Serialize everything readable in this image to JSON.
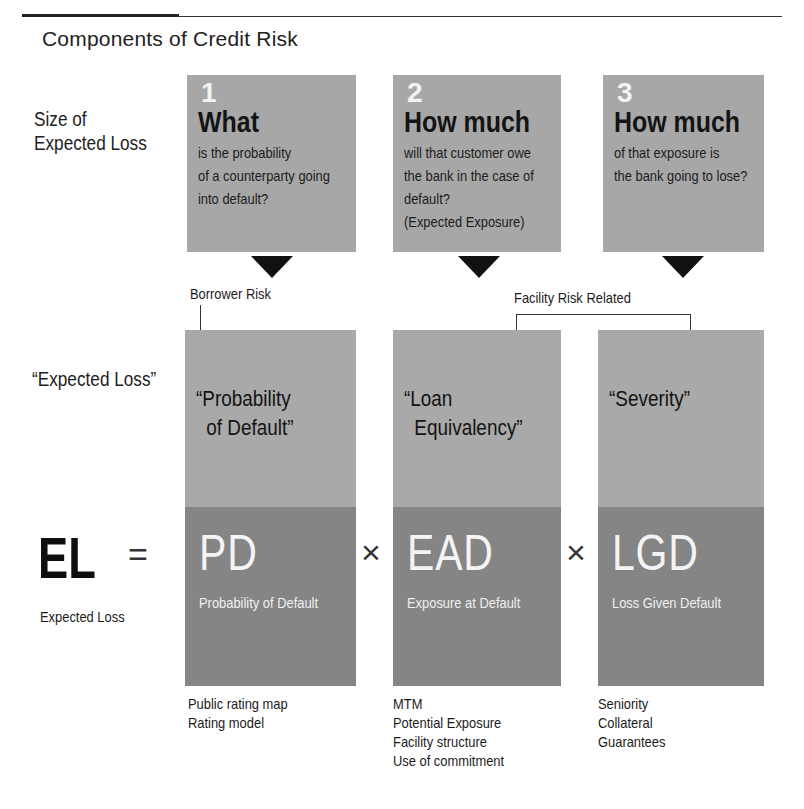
{
  "title": "Components of Credit Risk",
  "row_labels": {
    "size_of_expected_loss": [
      "Size of",
      "Expected Loss"
    ],
    "expected_loss_quoted": "“Expected Loss”"
  },
  "questions": [
    {
      "number": "1",
      "heading": "What",
      "lines": [
        "is the probability",
        "of a counterparty going",
        "into default?"
      ]
    },
    {
      "number": "2",
      "heading": "How much",
      "lines": [
        "will that customer owe",
        "the bank in the case of",
        "default?",
        "(Expected Exposure)"
      ]
    },
    {
      "number": "3",
      "heading": "How much",
      "lines": [
        "of that exposure is",
        "the bank going to lose?"
      ]
    }
  ],
  "risk_groups": {
    "borrower": "Borrower Risk",
    "facility": "Facility Risk Related"
  },
  "components": [
    {
      "quote_lines": [
        "“Probability",
        "of Default”"
      ],
      "abbr": "PD",
      "full_name": "Probability of Default",
      "drivers": [
        "Public rating map",
        "Rating model"
      ]
    },
    {
      "quote_lines": [
        "“Loan",
        "Equivalency”"
      ],
      "abbr": "EAD",
      "full_name": "Exposure at Default",
      "drivers": [
        "MTM",
        "Potential Exposure",
        "Facility structure",
        "Use of commitment"
      ]
    },
    {
      "quote_lines": [
        "“Severity”"
      ],
      "abbr": "LGD",
      "full_name": "Loss Given Default",
      "drivers": [
        "Seniority",
        "Collateral",
        "Guarantees"
      ]
    }
  ],
  "formula": {
    "lhs": "EL",
    "lhs_label": "Expected Loss",
    "equals": "=",
    "times": "×"
  },
  "colors": {
    "box_light": "#a9a9a9",
    "box_dark": "#858585",
    "arrow": "#111111",
    "text_light": "#f4f4f4"
  }
}
